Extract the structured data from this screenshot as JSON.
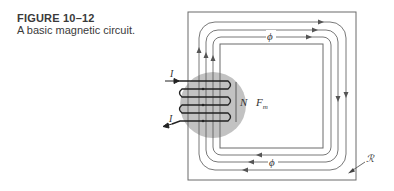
{
  "caption": {
    "figure_number": "FIGURE 10–12",
    "description": "A basic magnetic circuit."
  },
  "diagram": {
    "labels": {
      "current_in": "I",
      "current_out": "I",
      "turns": "N",
      "mmf": "F",
      "mmf_sub": "m",
      "flux_top": "ϕ",
      "flux_bottom": "ϕ",
      "reluctance": "ℛ"
    },
    "colors": {
      "core_lines": "#6a6a6a",
      "flux_lines": "#555555",
      "coil": "#222222",
      "coil_region": "#c2c2c2",
      "text": "#3a3a3a"
    }
  }
}
